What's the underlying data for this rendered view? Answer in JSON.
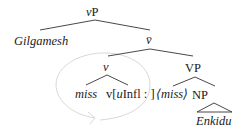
{
  "diagram": {
    "type": "syntax-tree",
    "nodes": {
      "root": {
        "label_prefix": "v",
        "label_suffix": "P"
      },
      "specifier": {
        "label": "Gilgamesh"
      },
      "vbar": {
        "label": "v̄"
      },
      "little_v": {
        "label": "v"
      },
      "vp": {
        "label": "VP"
      },
      "miss_head": {
        "label": "miss"
      },
      "v_feature": {
        "pre": "v[",
        "u": "u",
        "post": "Infl : ]"
      },
      "trace": {
        "label": "⟨miss⟩"
      },
      "np": {
        "label": "NP"
      },
      "object": {
        "label": "Enkidu"
      }
    },
    "colors": {
      "text": "#1a1a1a",
      "lines": "#333333",
      "movement_arc": "#d8d8d8"
    }
  }
}
